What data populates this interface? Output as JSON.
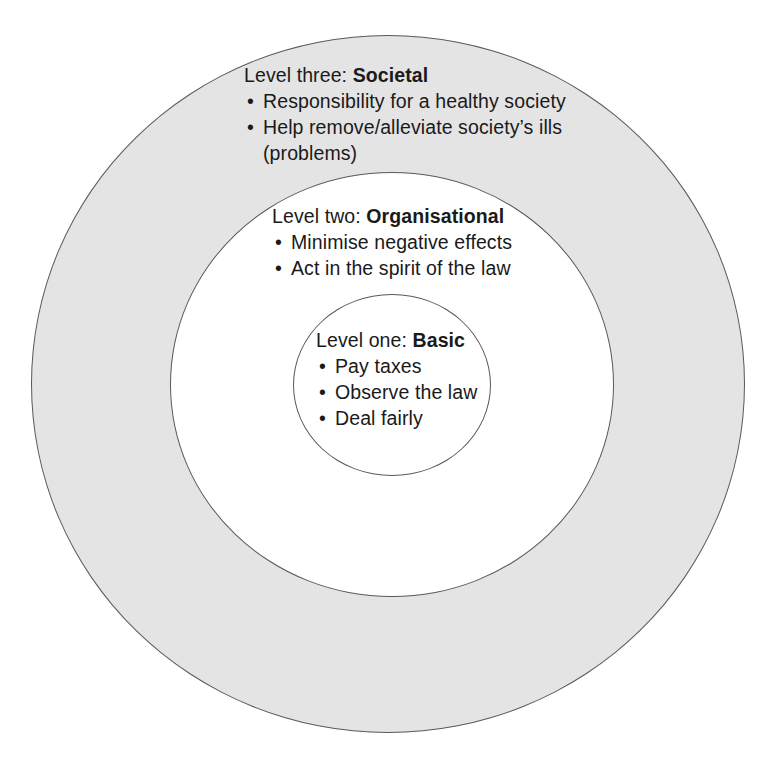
{
  "diagram": {
    "type": "concentric-circles",
    "colors": {
      "outer_ring_fill": "#e4e4e4",
      "middle_ring_fill": "#ffffff",
      "inner_circle_fill": "#ffffff",
      "stroke": "#58595b",
      "text": "#1a1a1a"
    },
    "levels": [
      {
        "id": "societal",
        "label_prefix": "Level three:",
        "label_name": "Societal",
        "bullets": [
          "Responsibility for a healthy society",
          "Help remove/alleviate society’s ills"
        ],
        "continuation": "(problems)"
      },
      {
        "id": "organisational",
        "label_prefix": "Level two:",
        "label_name": "Organisational",
        "bullets": [
          "Minimise negative effects",
          "Act in the spirit of the law"
        ],
        "continuation": ""
      },
      {
        "id": "basic",
        "label_prefix": "Level one:",
        "label_name": "Basic",
        "bullets": [
          "Pay taxes",
          "Observe the law",
          "Deal fairly"
        ],
        "continuation": ""
      }
    ],
    "bullet_glyph": "•"
  }
}
